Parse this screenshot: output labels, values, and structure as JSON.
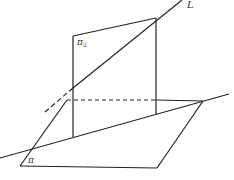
{
  "diagram": {
    "labels": {
      "line": "L",
      "plane_vertical": "π",
      "plane_vertical_sub": "2",
      "plane_base": "π"
    },
    "colors": {
      "stroke": "#222222",
      "background": "#ffffff"
    }
  }
}
